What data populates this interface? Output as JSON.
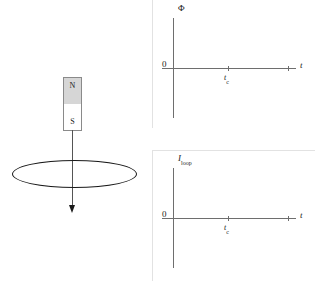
{
  "figure": {
    "width": 315,
    "height": 281
  },
  "magnet_diagram": {
    "north_pole_label": "N",
    "south_pole_label": "S",
    "north_fill_color": "#d6d6d6",
    "south_fill_color": "#ffffff",
    "outline_color": "#8a8a8a",
    "motion_arrow_name": "downward-motion-arrow",
    "loop_name": "conducting-loop-ellipse",
    "loop_stroke_color": "#1a1a1a"
  },
  "chart_data": [
    {
      "id": "flux-vs-time",
      "type": "line",
      "title": "",
      "ylabel": "Φ",
      "xlabel": "t",
      "origin_label": "0",
      "x_ticks": [
        {
          "label": "t",
          "sublabel": "c",
          "position_px": 76
        },
        {
          "label": "",
          "sublabel": "",
          "position_px": 136
        }
      ],
      "series": [
        {
          "name": "flux",
          "x": [],
          "y": []
        }
      ],
      "grid": false,
      "legend": false,
      "note": "Blank axes — no curve plotted; student is to sketch Φ(t)."
    },
    {
      "id": "induced-current-vs-time",
      "type": "line",
      "title": "",
      "ylabel_main": "I",
      "ylabel_sub": "loop",
      "xlabel": "t",
      "origin_label": "0",
      "x_ticks": [
        {
          "label": "t",
          "sublabel": "c",
          "position_px": 76
        },
        {
          "label": "",
          "sublabel": "",
          "position_px": 136
        }
      ],
      "series": [
        {
          "name": "I_loop",
          "x": [],
          "y": []
        }
      ],
      "grid": false,
      "legend": false,
      "note": "Blank axes — no curve plotted; student is to sketch I_loop(t)."
    }
  ]
}
